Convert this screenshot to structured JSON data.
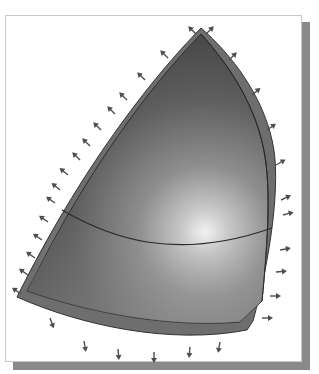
{
  "viewport": {
    "description": "3D shaded shell panel with edge constraint arrows",
    "colors": {
      "background": "#ffffff",
      "frame_border": "#c8c8c8",
      "shadow": "#8a8a8a",
      "shell_dark": "#5a5a5a",
      "shell_mid": "#8c8c8c",
      "shell_highlight": "#eeeeee",
      "edge_strip": "#6e6e6e",
      "outline": "#2e2e2e",
      "arrow": "#555555"
    }
  }
}
